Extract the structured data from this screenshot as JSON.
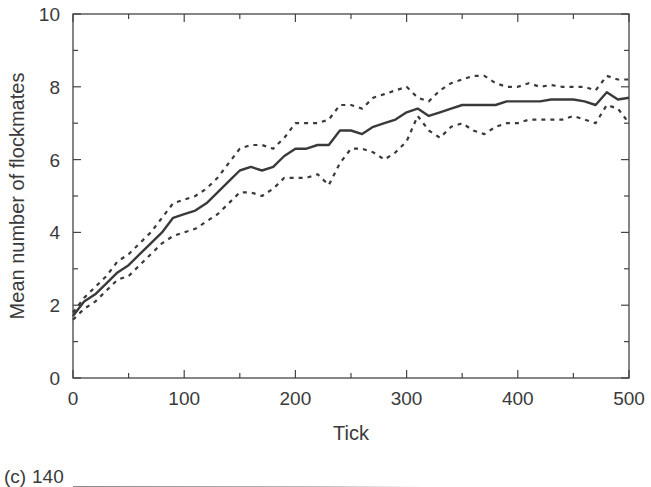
{
  "chart_data": {
    "type": "line",
    "title": "",
    "xlabel": "Tick",
    "ylabel": "Mean number of flockmates",
    "xlim": [
      0,
      500
    ],
    "ylim": [
      0,
      10
    ],
    "x_ticks": [
      0,
      100,
      200,
      300,
      400,
      500
    ],
    "y_ticks": [
      0,
      2,
      4,
      6,
      8,
      10
    ],
    "x_minor_ticks": [
      50,
      150,
      250,
      350,
      450
    ],
    "y_minor_ticks": [
      1,
      3,
      5,
      7,
      9
    ],
    "grid": false,
    "legend": null,
    "x": [
      0,
      10,
      20,
      30,
      40,
      50,
      60,
      70,
      80,
      90,
      100,
      110,
      120,
      130,
      140,
      150,
      160,
      170,
      180,
      190,
      200,
      210,
      220,
      230,
      240,
      250,
      260,
      270,
      280,
      290,
      300,
      310,
      320,
      330,
      340,
      350,
      360,
      370,
      380,
      390,
      400,
      410,
      420,
      430,
      440,
      450,
      460,
      470,
      480,
      490,
      500
    ],
    "series": [
      {
        "name": "mean",
        "style": "solid",
        "values": [
          1.7,
          2.1,
          2.3,
          2.6,
          2.9,
          3.1,
          3.4,
          3.7,
          4.0,
          4.4,
          4.5,
          4.6,
          4.8,
          5.1,
          5.4,
          5.7,
          5.8,
          5.7,
          5.8,
          6.1,
          6.3,
          6.3,
          6.4,
          6.4,
          6.8,
          6.8,
          6.7,
          6.9,
          7.0,
          7.1,
          7.3,
          7.4,
          7.2,
          7.3,
          7.4,
          7.5,
          7.5,
          7.5,
          7.5,
          7.6,
          7.6,
          7.6,
          7.6,
          7.65,
          7.65,
          7.65,
          7.6,
          7.5,
          7.85,
          7.65,
          7.7
        ]
      },
      {
        "name": "upper bound",
        "style": "dashed",
        "values": [
          1.8,
          2.2,
          2.5,
          2.8,
          3.2,
          3.4,
          3.7,
          4.0,
          4.4,
          4.8,
          4.9,
          5.0,
          5.2,
          5.5,
          5.9,
          6.3,
          6.4,
          6.4,
          6.3,
          6.6,
          7.0,
          7.0,
          7.0,
          7.1,
          7.5,
          7.5,
          7.4,
          7.7,
          7.8,
          7.9,
          8.0,
          7.7,
          7.6,
          7.9,
          8.1,
          8.2,
          8.3,
          8.3,
          8.1,
          8.0,
          8.0,
          8.1,
          8.0,
          8.05,
          8.0,
          8.0,
          8.0,
          7.9,
          8.3,
          8.2,
          8.2
        ]
      },
      {
        "name": "lower bound",
        "style": "dashed",
        "values": [
          1.6,
          1.9,
          2.1,
          2.4,
          2.7,
          2.8,
          3.1,
          3.4,
          3.7,
          3.9,
          4.0,
          4.1,
          4.3,
          4.5,
          4.8,
          5.1,
          5.1,
          5.0,
          5.2,
          5.5,
          5.5,
          5.5,
          5.6,
          5.3,
          5.9,
          6.3,
          6.3,
          6.2,
          6.0,
          6.2,
          6.5,
          7.2,
          6.8,
          6.6,
          6.9,
          7.0,
          6.8,
          6.7,
          6.9,
          7.0,
          7.0,
          7.1,
          7.1,
          7.1,
          7.1,
          7.2,
          7.1,
          7.0,
          7.5,
          7.4,
          7.0
        ]
      }
    ]
  },
  "axes": {
    "xlabel": "Tick",
    "ylabel": "Mean number of flockmates",
    "x_tick_labels": [
      "0",
      "100",
      "200",
      "300",
      "400",
      "500"
    ],
    "y_tick_labels": [
      "0",
      "2",
      "4",
      "6",
      "8",
      "10"
    ]
  },
  "next_panel": {
    "label": "(c)",
    "first_tick_label": "140"
  }
}
